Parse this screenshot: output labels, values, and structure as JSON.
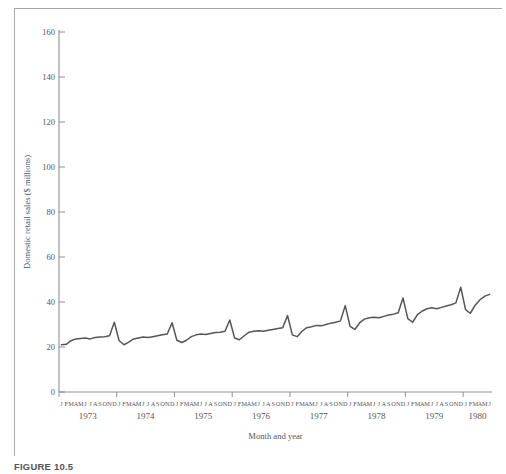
{
  "figure": {
    "caption": "FIGURE 10.5"
  },
  "chart_data": {
    "type": "line",
    "title": "",
    "xlabel": "Month and year",
    "ylabel": "Domestic retail sales ($ millions)",
    "ylim": [
      0,
      160
    ],
    "yticks": [
      0,
      20,
      40,
      60,
      80,
      100,
      120,
      140,
      160
    ],
    "ytick_labels": [
      "0",
      "20",
      "40",
      "60",
      "80",
      "100",
      "120",
      "140",
      "160"
    ],
    "grid": false,
    "legend": null,
    "line_color": "#55555a",
    "month_letters": [
      "J",
      "F",
      "M",
      "A",
      "M",
      "J",
      "J",
      "A",
      "S",
      "O",
      "N",
      "D"
    ],
    "years": [
      "1973",
      "1974",
      "1975",
      "1976",
      "1977",
      "1978",
      "1979",
      "1980"
    ],
    "x_tick_count": 8,
    "series": [
      {
        "name": "Domestic retail sales",
        "x": [
          "1973-01",
          "1973-02",
          "1973-03",
          "1973-04",
          "1973-05",
          "1973-06",
          "1973-07",
          "1973-08",
          "1973-09",
          "1973-10",
          "1973-11",
          "1973-12",
          "1974-01",
          "1974-02",
          "1974-03",
          "1974-04",
          "1974-05",
          "1974-06",
          "1974-07",
          "1974-08",
          "1974-09",
          "1974-10",
          "1974-11",
          "1974-12",
          "1975-01",
          "1975-02",
          "1975-03",
          "1975-04",
          "1975-05",
          "1975-06",
          "1975-07",
          "1975-08",
          "1975-09",
          "1975-10",
          "1975-11",
          "1975-12",
          "1976-01",
          "1976-02",
          "1976-03",
          "1976-04",
          "1976-05",
          "1976-06",
          "1976-07",
          "1976-08",
          "1976-09",
          "1976-10",
          "1976-11",
          "1976-12",
          "1977-01",
          "1977-02",
          "1977-03",
          "1977-04",
          "1977-05",
          "1977-06",
          "1977-07",
          "1977-08",
          "1977-09",
          "1977-10",
          "1977-11",
          "1977-12",
          "1978-01",
          "1978-02",
          "1978-03",
          "1978-04",
          "1978-05",
          "1978-06",
          "1978-07",
          "1978-08",
          "1978-09",
          "1978-10",
          "1978-11",
          "1978-12",
          "1979-01",
          "1979-02",
          "1979-03",
          "1979-04",
          "1979-05",
          "1979-06",
          "1979-07",
          "1979-08",
          "1979-09",
          "1979-10",
          "1979-11",
          "1979-12",
          "1980-01",
          "1980-02",
          "1980-03",
          "1980-04",
          "1980-05",
          "1980-06"
        ],
        "values": [
          21.0,
          21.2,
          22.8,
          23.6,
          23.8,
          24.0,
          23.6,
          24.2,
          24.4,
          24.6,
          25.0,
          31.0,
          22.8,
          21.0,
          22.2,
          23.6,
          24.0,
          24.4,
          24.2,
          24.6,
          25.0,
          25.4,
          25.8,
          30.8,
          23.0,
          22.0,
          23.0,
          24.6,
          25.4,
          25.8,
          25.6,
          26.0,
          26.4,
          26.6,
          27.0,
          32.0,
          24.0,
          23.2,
          25.0,
          26.6,
          27.0,
          27.2,
          27.0,
          27.4,
          27.8,
          28.2,
          28.6,
          34.0,
          25.4,
          24.6,
          27.0,
          28.6,
          29.0,
          29.6,
          29.4,
          30.0,
          30.6,
          31.0,
          31.6,
          38.4,
          29.2,
          27.8,
          30.8,
          32.4,
          33.0,
          33.2,
          33.0,
          33.6,
          34.2,
          34.6,
          35.2,
          41.8,
          32.6,
          31.0,
          34.4,
          36.0,
          37.0,
          37.4,
          37.0,
          37.6,
          38.2,
          38.8,
          39.6,
          46.6,
          36.6,
          35.0,
          38.6,
          41.0,
          42.6,
          43.4
        ]
      }
    ]
  }
}
